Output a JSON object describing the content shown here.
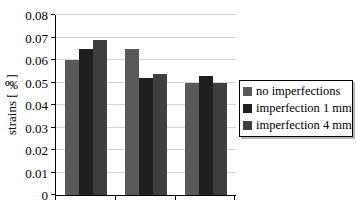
{
  "chart": {
    "ylabel": "strains [‰]"
  },
  "chart_data": {
    "type": "bar",
    "title": "",
    "xlabel": "",
    "ylabel": "strains [‰]",
    "categories": [
      "",
      "",
      ""
    ],
    "series": [
      {
        "name": "no imperfections",
        "color": "#595959",
        "values": [
          0.06,
          0.065,
          0.05
        ]
      },
      {
        "name": "imperfection 1 mm",
        "color": "#1f1f1f",
        "values": [
          0.065,
          0.052,
          0.053
        ]
      },
      {
        "name": "imperfection 4 mm",
        "color": "#3f3f3f",
        "values": [
          0.069,
          0.054,
          0.05
        ]
      }
    ],
    "ylim": [
      0,
      0.08
    ],
    "ytick_step": 0.01,
    "ytick_labels": [
      "0",
      "0.01",
      "0.02",
      "0.03",
      "0.04",
      "0.05",
      "0.06",
      "0.07",
      "0.08"
    ],
    "grid": true,
    "legend_position": "right",
    "note_colors": {
      "gridline": "#d4d4d4",
      "axis": "#000000"
    }
  }
}
